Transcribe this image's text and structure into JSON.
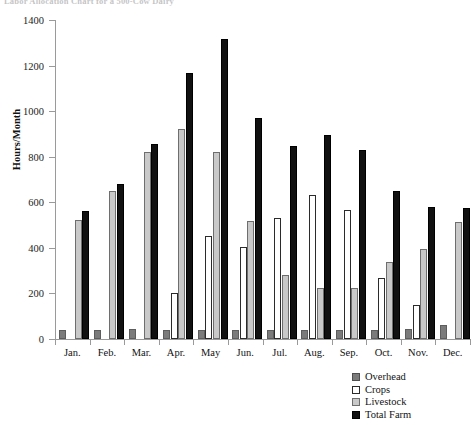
{
  "chart_data": {
    "type": "bar",
    "title": "Labor Allocation Chart for a 500-Cow Dairy",
    "xlabel": "",
    "ylabel": "Hours/Month",
    "ylim": [
      0,
      1400
    ],
    "ytick_step": 200,
    "yticks": [
      0,
      200,
      400,
      600,
      800,
      1000,
      1200,
      1400
    ],
    "ytick_labels": [
      "0",
      "200",
      "400",
      "600",
      "800",
      "1000",
      "1200",
      "1400"
    ],
    "grid": false,
    "legend_position": "bottom-right",
    "categories": [
      "Jan.",
      "Feb.",
      "Mar.",
      "Apr.",
      "May",
      "Jun.",
      "Jul.",
      "Aug.",
      "Sep.",
      "Oct.",
      "Nov.",
      "Dec."
    ],
    "series": [
      {
        "name": "Overhead",
        "color": "#7b7b7b",
        "values": [
          38,
          40,
          42,
          40,
          38,
          40,
          40,
          40,
          38,
          40,
          45,
          60
        ]
      },
      {
        "name": "Crops",
        "color": "#ffffff",
        "values": [
          0,
          0,
          0,
          202,
          452,
          405,
          530,
          630,
          565,
          268,
          150,
          0
        ]
      },
      {
        "name": "Livestock",
        "color": "#c9c9c9",
        "values": [
          522,
          648,
          820,
          921,
          820,
          518,
          280,
          222,
          222,
          338,
          393,
          515
        ]
      },
      {
        "name": "Total Farm",
        "color": "#111111",
        "values": [
          561,
          680,
          855,
          1167,
          1316,
          970,
          848,
          895,
          828,
          648,
          580,
          573
        ]
      }
    ]
  },
  "legend": {
    "items": [
      {
        "label": "Overhead"
      },
      {
        "label": "Crops"
      },
      {
        "label": "Livestock"
      },
      {
        "label": "Total Farm"
      }
    ]
  }
}
